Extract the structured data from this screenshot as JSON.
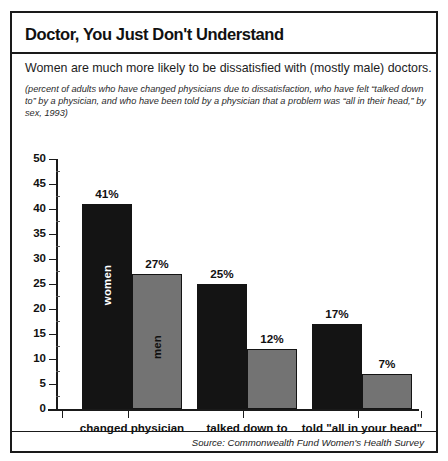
{
  "chart_data": {
    "type": "bar",
    "title": "Doctor, You Just Don't Understand",
    "subtitle": "Women are much more likely to be dissatisfied with (mostly male) doctors.",
    "note": "(percent of adults who have changed physicians due to dissatisfaction, who have felt “talked down to” by a physician, and who have been told by a physician that a problem was “all in their head,” by sex, 1993)",
    "source": "Source: Commonwealth Fund Women's Health Survey",
    "xlabel": "",
    "ylabel": "",
    "ylim": [
      0,
      50
    ],
    "ytick_step": 5,
    "grid": false,
    "legend_position": "in-bar",
    "value_suffix": "%",
    "categories": [
      "changed physician",
      "talked down to",
      "told \"all in your head\""
    ],
    "yticks": [
      "50",
      "45",
      "40",
      "35",
      "30",
      "25",
      "20",
      "15",
      "10",
      "5",
      "0"
    ],
    "series": [
      {
        "name": "women",
        "color": "#141414",
        "in_bar_label": "women",
        "values": [
          41,
          25,
          17
        ],
        "labels": [
          "41%",
          "25%",
          "17%"
        ]
      },
      {
        "name": "men",
        "color": "#737373",
        "in_bar_label": "men",
        "values": [
          27,
          12,
          7
        ],
        "labels": [
          "27%",
          "12%",
          "7%"
        ]
      }
    ]
  },
  "colors": {
    "women_bar": "#141414",
    "men_bar": "#737373",
    "frame": "#1a1a1a",
    "background": "#ffffff",
    "text": "#111111"
  }
}
